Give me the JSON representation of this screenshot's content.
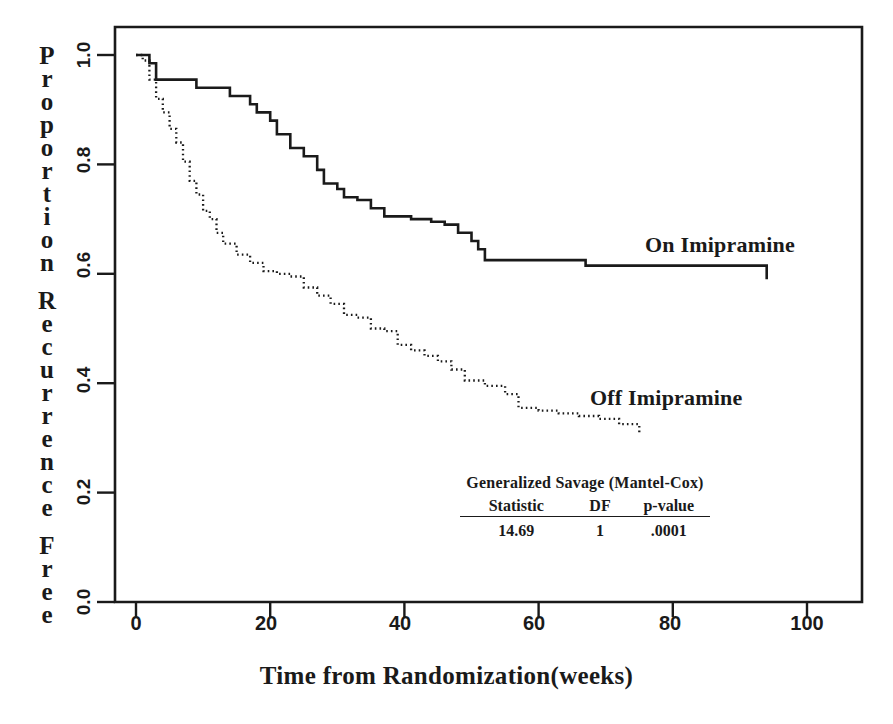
{
  "figure": {
    "background": "#ffffff",
    "ink_color": "#1a1a1a"
  },
  "axes": {
    "x_title": "Time from Randomization(weeks)",
    "y_title_letters": [
      "P",
      "r",
      "o",
      "p",
      "o",
      "r",
      "t",
      "i",
      "o",
      "n",
      " ",
      "R",
      "e",
      "c",
      "u",
      "r",
      "r",
      "e",
      "n",
      "c",
      "e",
      " ",
      "F",
      "r",
      "e",
      "e"
    ],
    "y_title_text": "Proportion Recurrence Free",
    "x_ticks": [
      "0",
      "20",
      "40",
      "60",
      "80",
      "100"
    ],
    "y_ticks": [
      "1.0",
      "0.8",
      "0.6",
      "0.4",
      "0.2",
      "0.0"
    ]
  },
  "labels": {
    "on_curve": "On Imipramine",
    "off_curve": "Off Imipramine"
  },
  "stats": {
    "test_name": "Generalized Savage (Mantel-Cox)",
    "headers": [
      "Statistic",
      "DF",
      "p-value"
    ],
    "values": [
      "14.69",
      "1",
      ".0001"
    ]
  },
  "chart_data": {
    "type": "line",
    "title": "",
    "subtitle": "",
    "xlabel": "Time from Randomization(weeks)",
    "ylabel": "Proportion Recurrence Free",
    "xlim": [
      0,
      108
    ],
    "ylim": [
      0.0,
      1.04
    ],
    "xticks": [
      0,
      20,
      40,
      60,
      80,
      100
    ],
    "yticks": [
      0.0,
      0.2,
      0.4,
      0.6,
      0.8,
      1.0
    ],
    "grid": false,
    "legend": "inline-annotations",
    "curve_type": "kaplan-meier step",
    "annotations": [
      {
        "text": "On Imipramine",
        "x": 76,
        "y": 0.645
      },
      {
        "text": "Off Imipramine",
        "x": 68,
        "y": 0.355
      },
      {
        "text": "Generalized Savage (Mantel-Cox)",
        "x": 55,
        "y": 0.235
      },
      {
        "text": "Statistic  DF  p-value",
        "x": 55,
        "y": 0.185
      },
      {
        "text": "14.69  1  .0001",
        "x": 55,
        "y": 0.145
      }
    ],
    "series": [
      {
        "name": "On Imipramine",
        "style": "solid",
        "x": [
          0,
          1,
          2,
          3,
          6,
          9,
          12,
          14,
          16,
          17,
          18,
          20,
          21,
          23,
          25,
          27,
          28,
          29,
          30,
          31,
          33,
          35,
          37,
          39,
          41,
          44,
          46,
          48,
          50,
          51,
          52,
          60,
          67,
          80,
          93,
          94
        ],
        "y": [
          1.0,
          1.0,
          0.985,
          0.955,
          0.955,
          0.94,
          0.94,
          0.925,
          0.925,
          0.91,
          0.895,
          0.88,
          0.855,
          0.83,
          0.815,
          0.79,
          0.765,
          0.765,
          0.755,
          0.74,
          0.735,
          0.72,
          0.705,
          0.705,
          0.7,
          0.695,
          0.69,
          0.675,
          0.66,
          0.645,
          0.625,
          0.625,
          0.615,
          0.615,
          0.615,
          0.59
        ]
      },
      {
        "name": "Off Imipramine",
        "style": "dotted",
        "x": [
          0,
          1,
          2,
          3,
          4,
          5,
          6,
          7,
          8,
          9,
          10,
          11,
          12,
          13,
          15,
          17,
          19,
          21,
          23,
          25,
          27,
          29,
          31,
          33,
          35,
          37,
          39,
          41,
          43,
          45,
          47,
          49,
          52,
          55,
          57,
          60,
          63,
          66,
          69,
          72,
          75
        ],
        "y": [
          1.0,
          0.99,
          0.955,
          0.92,
          0.895,
          0.865,
          0.84,
          0.805,
          0.77,
          0.745,
          0.715,
          0.7,
          0.675,
          0.655,
          0.635,
          0.62,
          0.605,
          0.6,
          0.595,
          0.575,
          0.56,
          0.545,
          0.525,
          0.52,
          0.5,
          0.495,
          0.47,
          0.46,
          0.45,
          0.44,
          0.425,
          0.405,
          0.395,
          0.38,
          0.355,
          0.35,
          0.345,
          0.34,
          0.335,
          0.325,
          0.31
        ]
      }
    ]
  }
}
